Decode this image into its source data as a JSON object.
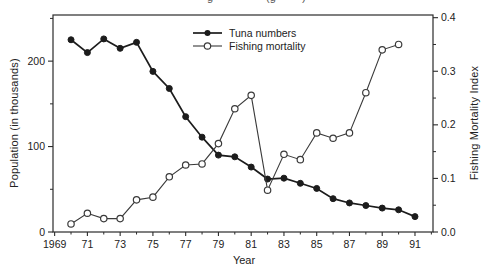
{
  "figure": {
    "top_fragment_marks": [
      {
        "text": "g",
        "x": 207
      },
      {
        "text": "(g",
        "x": 266
      },
      {
        "text": ")",
        "x": 302
      }
    ]
  },
  "chart_data": {
    "type": "line",
    "title": "",
    "xlabel": "Year",
    "ylabel_left": "Population (in thousands)",
    "ylabel_right": "Fishing Mortality Index",
    "x_range": [
      1968.9,
      1992.1
    ],
    "y_left_range": [
      0,
      254
    ],
    "y_right_range": [
      0,
      0.405
    ],
    "grid": false,
    "legend_position": "top-center-inside",
    "x_ticks": {
      "major_years": [
        1969,
        1971,
        1973,
        1975,
        1977,
        1979,
        1981,
        1983,
        1985,
        1987,
        1989,
        1991
      ],
      "major_labels": [
        "1969",
        "71",
        "73",
        "75",
        "77",
        "79",
        "81",
        "83",
        "85",
        "87",
        "89",
        "91"
      ],
      "minor_years": [
        1970,
        1972,
        1974,
        1976,
        1978,
        1980,
        1982,
        1984,
        1986,
        1988,
        1990,
        1992
      ]
    },
    "left_axis": {
      "major": [
        {
          "v": 0,
          "label": "0"
        },
        {
          "v": 100,
          "label": "100"
        },
        {
          "v": 200,
          "label": "200"
        }
      ],
      "minor": [
        50,
        150,
        250
      ]
    },
    "right_axis": {
      "major": [
        {
          "v": 0.0,
          "label": "0.0"
        },
        {
          "v": 0.1,
          "label": "0.1"
        },
        {
          "v": 0.2,
          "label": "0.2"
        },
        {
          "v": 0.3,
          "label": "0.3"
        },
        {
          "v": 0.4,
          "label": "0.4"
        }
      ],
      "minor": [
        0.05,
        0.15,
        0.25,
        0.35
      ]
    },
    "series": [
      {
        "name": "Tuna numbers",
        "axis": "left",
        "marker": "filled-circle",
        "color": "#1c1c1c",
        "line_width": 1.7,
        "years": [
          1970,
          1971,
          1972,
          1973,
          1974,
          1975,
          1976,
          1977,
          1978,
          1979,
          1980,
          1981,
          1982,
          1983,
          1984,
          1985,
          1986,
          1987,
          1988,
          1989,
          1990,
          1991
        ],
        "values": [
          225,
          210,
          226,
          215,
          222,
          188,
          168,
          135,
          111,
          90,
          88,
          76,
          62,
          63,
          57,
          51,
          39,
          34,
          31,
          28,
          26,
          18
        ]
      },
      {
        "name": "Fishing mortality",
        "axis": "right",
        "marker": "open-circle",
        "color": "#3a3a3a",
        "line_width": 1.1,
        "years": [
          1970,
          1971,
          1972,
          1973,
          1974,
          1975,
          1976,
          1977,
          1978,
          1979,
          1980,
          1981,
          1982,
          1983,
          1984,
          1985,
          1986,
          1987,
          1988,
          1989,
          1990
        ],
        "values": [
          0.015,
          0.035,
          0.025,
          0.025,
          0.06,
          0.065,
          0.103,
          0.125,
          0.127,
          0.165,
          0.23,
          0.255,
          0.078,
          0.145,
          0.135,
          0.185,
          0.175,
          0.185,
          0.26,
          0.34,
          0.35
        ]
      }
    ]
  }
}
